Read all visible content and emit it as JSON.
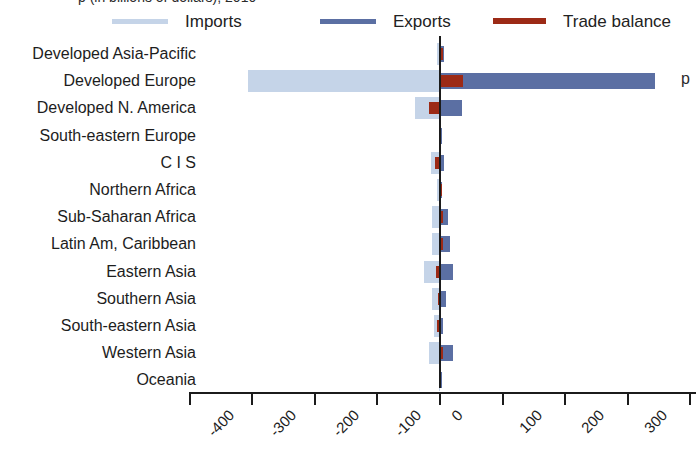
{
  "title_sliver": "p (in billions of dollars), 2010",
  "edge_cut_text": "p",
  "legend": {
    "items": [
      {
        "label": "Imports",
        "color": "#c5d4e8",
        "name": "imports"
      },
      {
        "label": "Exports",
        "color": "#5b6fa3",
        "name": "exports"
      },
      {
        "label": "Trade balance",
        "color": "#9c2a16",
        "name": "trade-balance"
      }
    ]
  },
  "chart_data": {
    "type": "bar",
    "orientation": "horizontal",
    "title": "",
    "xlabel": "",
    "ylabel": "",
    "xlim": [
      -400,
      400
    ],
    "xticks": [
      -400,
      -300,
      -200,
      -100,
      0,
      100,
      200,
      300,
      400
    ],
    "xticklabels": [
      "-400",
      "-300",
      "-200",
      "-100",
      "0",
      "100",
      "200",
      "300",
      "400"
    ],
    "grid": false,
    "legend_position": "top",
    "categories": [
      "Developed Asia-Pacific",
      "Developed Europe",
      "Developed N. America",
      "South-eastern Europe",
      "C I S",
      "Northern Africa",
      "Sub-Saharan Africa",
      "Latin Am, Caribbean",
      "Eastern Asia",
      "Southern Asia",
      "South-eastern Asia",
      "Western Asia",
      "Oceania"
    ],
    "series": [
      {
        "name": "Imports",
        "color": "#c5d4e8",
        "values": [
          -4,
          -307,
          -40,
          -2,
          -14,
          -4,
          -12,
          -13,
          -26,
          -12,
          -9,
          -18,
          -1
        ]
      },
      {
        "name": "Exports",
        "color": "#5b6fa3",
        "values": [
          7,
          344,
          35,
          2,
          6,
          3,
          12,
          16,
          20,
          10,
          5,
          20,
          1
        ]
      },
      {
        "name": "Trade balance",
        "color": "#9c2a16",
        "values": [
          3,
          37,
          -18,
          0,
          -8,
          -1,
          1,
          3,
          -6,
          -3,
          -4,
          2,
          0
        ]
      }
    ]
  }
}
